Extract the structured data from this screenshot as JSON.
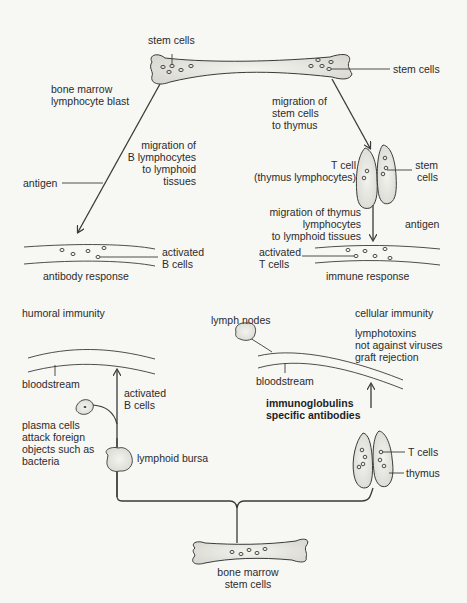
{
  "diagram": {
    "top_section": {
      "bone_top_label": "stem cells",
      "bone_right_label": "stem cells",
      "bone_marrow_label": "bone marrow\nlymphocyte blast",
      "migration_b_label": "migration of\nB lymphocytes\nto lymphoid\ntissues",
      "antigen_left_label": "antigen",
      "migration_stem_label": "migration of\nstem cells\nto thymus",
      "t_cell_label": "T cell\n(thymus lymphocytes)",
      "thymus_stem_label": "stem\ncells",
      "migration_thymus_label": "migration of thymus\nlymphocytes\nto lymphoid tissues",
      "antigen_right_label": "antigen",
      "activated_b_label": "activated\nB cells",
      "activated_t_label": "activated\nT cells",
      "antibody_response_label": "antibody response",
      "immune_response_label": "immune response"
    },
    "bottom_section": {
      "humoral_title": "humoral immunity",
      "cellular_title": "cellular immunity",
      "lymph_nodes_label": "lymph nodes",
      "cellular_effects_label": "lymphotoxins\nnot against viruses\ngraft rejection",
      "bloodstream_left_label": "bloodstream",
      "bloodstream_right_label": "bloodstream",
      "activated_b_label": "activated\nB cells",
      "immunoglobulins_label": "immunoglobulins\nspecific antibodies",
      "plasma_cells_label": "plasma cells\nattack foreign\nobjects such as\nbacteria",
      "lymphoid_bursa_label": "lymphoid bursa",
      "t_cells_label": "T cells",
      "thymus_label": "thymus",
      "bone_marrow_label": "bone marrow\nstem cells"
    },
    "colors": {
      "line": "#3a3a3a",
      "fill": "#ecece6",
      "background": "#f7f7f4"
    }
  }
}
